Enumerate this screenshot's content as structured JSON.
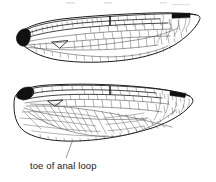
{
  "figure": {
    "background_color": "#ffffff",
    "width": 216,
    "height": 182,
    "ink_color": "#1c1c1c",
    "vein_color": "#3a3a3a",
    "mark_color": "#111111",
    "leader_color": "#6b6b6b"
  },
  "annotations": {
    "anal_loop_label": "toe of anal loop"
  },
  "specimens": [
    {
      "name": "forewing",
      "position": "upper",
      "features": {
        "basal_mark": "black basal patch",
        "pterostigma": "dark pterostigma near leading edge of apex",
        "nodus": "thickened crossvein at mid leading edge"
      }
    },
    {
      "name": "hindwing",
      "position": "lower",
      "features": {
        "basal_mark": "black basal patch",
        "pterostigma": "dark pterostigma near leading edge of apex",
        "anal_loop": "foot-shaped cell cluster at wing base",
        "toe_of_anal_loop": "distal tip of the anal loop"
      }
    }
  ]
}
